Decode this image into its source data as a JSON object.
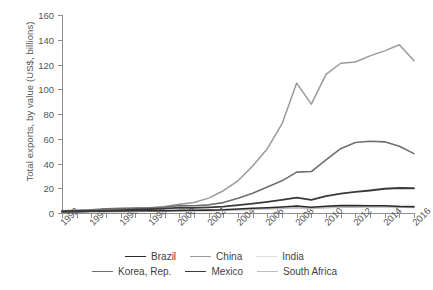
{
  "chart_data": {
    "type": "line",
    "title": "",
    "xlabel": "",
    "ylabel": "Total exports, by value (US$, billions)",
    "ylim": [
      0,
      160
    ],
    "yticks": [
      0,
      20,
      40,
      60,
      80,
      100,
      120,
      140,
      160
    ],
    "xlim": [
      1992,
      2016
    ],
    "xticks": [
      1992,
      1994,
      1996,
      1998,
      2000,
      2002,
      2004,
      2006,
      2008,
      2010,
      2012,
      2014,
      2016
    ],
    "x": [
      1992,
      1993,
      1994,
      1995,
      1996,
      1997,
      1998,
      1999,
      2000,
      2001,
      2002,
      2003,
      2004,
      2005,
      2006,
      2007,
      2008,
      2009,
      2010,
      2011,
      2012,
      2013,
      2014,
      2015,
      2016
    ],
    "grid": false,
    "legend_position": "bottom",
    "series": [
      {
        "name": "Brazil",
        "color": "#2b2b2b",
        "width": 1.6,
        "values": [
          1.2,
          1.3,
          1.5,
          1.6,
          1.7,
          1.9,
          1.9,
          1.8,
          2.1,
          2.2,
          2.3,
          2.6,
          3.2,
          3.8,
          4.3,
          4.9,
          5.6,
          4.6,
          5.4,
          6.0,
          6.0,
          5.9,
          5.8,
          5.2,
          5.0
        ]
      },
      {
        "name": "China",
        "color": "#9a9a9a",
        "width": 1.5,
        "values": [
          1.5,
          1.8,
          2.2,
          2.6,
          3.0,
          3.6,
          4.2,
          5.2,
          7.0,
          8.5,
          12.0,
          18.0,
          26.0,
          38.0,
          52.0,
          72.0,
          105.0,
          88.0,
          112.0,
          121.0,
          122.0,
          127.0,
          131.0,
          136.0,
          123.0
        ]
      },
      {
        "name": "India",
        "color": "#dcdcdc",
        "width": 1.5,
        "values": [
          0.6,
          0.7,
          0.8,
          0.9,
          1.0,
          1.1,
          1.2,
          1.3,
          1.5,
          1.6,
          1.8,
          2.1,
          2.5,
          2.9,
          3.3,
          3.8,
          4.3,
          4.0,
          4.6,
          5.1,
          5.3,
          5.6,
          5.9,
          6.0,
          6.1
        ]
      },
      {
        "name": "Korea, Rep.",
        "color": "#6e6e6e",
        "width": 1.6,
        "values": [
          1.8,
          2.1,
          2.6,
          3.4,
          3.8,
          4.1,
          3.9,
          4.6,
          6.0,
          5.8,
          6.6,
          8.4,
          12.0,
          16.0,
          21.0,
          26.0,
          33.0,
          33.5,
          43.0,
          52.0,
          57.0,
          58.0,
          57.5,
          54.0,
          48.0
        ]
      },
      {
        "name": "Mexico",
        "color": "#3a3a3a",
        "width": 1.8,
        "values": [
          1.0,
          1.2,
          1.5,
          2.0,
          2.4,
          2.8,
          3.2,
          3.6,
          4.4,
          4.2,
          4.6,
          5.2,
          6.4,
          7.6,
          9.0,
          10.6,
          12.4,
          10.6,
          13.6,
          15.6,
          17.0,
          18.2,
          19.6,
          20.2,
          20.0
        ]
      },
      {
        "name": "South Africa",
        "color": "#bcbcbc",
        "width": 1.5,
        "values": [
          0.8,
          0.9,
          1.0,
          1.2,
          1.3,
          1.4,
          1.4,
          1.5,
          1.8,
          1.8,
          2.0,
          2.3,
          2.7,
          3.0,
          3.4,
          3.8,
          4.2,
          3.6,
          4.2,
          4.6,
          4.7,
          4.8,
          4.9,
          4.6,
          4.5
        ]
      }
    ]
  },
  "legend": {
    "rows": [
      [
        "Brazil",
        "China",
        "India"
      ],
      [
        "Korea, Rep.",
        "Mexico",
        "South Africa"
      ]
    ]
  }
}
